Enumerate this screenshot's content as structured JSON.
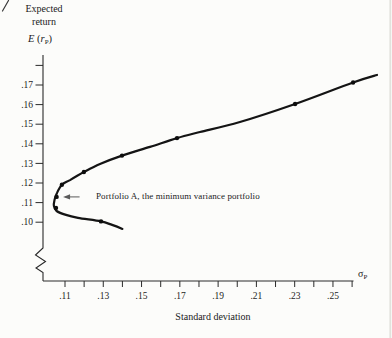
{
  "labels": {
    "y_title_line1": "Expected",
    "y_title_line2": "return",
    "y_symbol_e": "E",
    "y_symbol_open": " (",
    "y_symbol_r": "r",
    "y_symbol_sub": "P",
    "y_symbol_close": ")",
    "x_symbol_sigma": "σ",
    "x_symbol_sub": "P",
    "x_title": "Standard deviation"
  },
  "annotation": {
    "text": "Portfolio A, the minimum variance portfolio"
  },
  "chart_data": {
    "type": "line",
    "title": "",
    "xlabel": "Standard deviation",
    "ylabel": "Expected return",
    "x_axis_symbol": "σP",
    "y_axis_symbol": "E(rP)",
    "xlim": [
      0.098,
      0.273
    ],
    "ylim": [
      0.093,
      0.182
    ],
    "grid": false,
    "y_axis_break": true,
    "x_ticks": [
      0.11,
      0.12,
      0.13,
      0.14,
      0.15,
      0.16,
      0.17,
      0.18,
      0.19,
      0.2,
      0.21,
      0.22,
      0.23,
      0.24,
      0.25,
      0.26
    ],
    "x_tick_labels": [
      ".11",
      "",
      ".13",
      "",
      ".15",
      "",
      ".17",
      "",
      ".19",
      "",
      ".21",
      "",
      ".23",
      "",
      ".25",
      ""
    ],
    "y_ticks": [
      0.18,
      0.17,
      0.16,
      0.15,
      0.14,
      0.13,
      0.12,
      0.11,
      0.1
    ],
    "y_tick_labels": [
      "",
      ".17",
      ".16",
      ".15",
      ".14",
      ".13",
      ".12",
      ".11",
      ".10"
    ],
    "series": [
      {
        "name": "minimum-variance frontier",
        "points": [
          [
            0.273,
            0.1751
          ],
          [
            0.2605,
            0.1713
          ],
          [
            0.2302,
            0.1603
          ],
          [
            0.2014,
            0.1511
          ],
          [
            0.1805,
            0.146
          ],
          [
            0.1685,
            0.1429
          ],
          [
            0.1544,
            0.1384
          ],
          [
            0.1398,
            0.134
          ],
          [
            0.1283,
            0.1297
          ],
          [
            0.1199,
            0.1256
          ],
          [
            0.1126,
            0.1215
          ],
          [
            0.1084,
            0.1191
          ],
          [
            0.1058,
            0.1149
          ],
          [
            0.1045,
            0.1113
          ],
          [
            0.1042,
            0.1083
          ],
          [
            0.1056,
            0.1057
          ],
          [
            0.1105,
            0.1037
          ],
          [
            0.1168,
            0.1022
          ],
          [
            0.1288,
            0.1004
          ],
          [
            0.1346,
            0.0986
          ],
          [
            0.14,
            0.0966
          ]
        ]
      }
    ],
    "marked_points": [
      [
        0.1084,
        0.1191
      ],
      [
        0.1056,
        0.1129
      ],
      [
        0.1053,
        0.1073
      ],
      [
        0.1199,
        0.1256
      ],
      [
        0.1398,
        0.134
      ],
      [
        0.1685,
        0.1429
      ],
      [
        0.2302,
        0.1603
      ],
      [
        0.2605,
        0.1713
      ],
      [
        0.1288,
        0.1004
      ]
    ],
    "portfolio_a": {
      "sigma": 0.1056,
      "expected_return": 0.1129,
      "label": "Portfolio A, the minimum variance portfolio"
    }
  }
}
